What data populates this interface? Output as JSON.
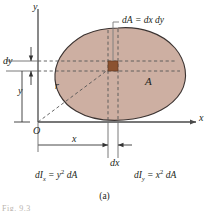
{
  "figure": {
    "caption": "(a)",
    "footnote": "Fig. 9.3",
    "axes": {
      "y_label": "y",
      "x_label": "x",
      "origin_label": "O"
    },
    "labels": {
      "dy": "dy",
      "y": "y",
      "r": "r",
      "x": "x",
      "dx": "dx",
      "area": "A",
      "element_callout_lead": "dA",
      "element_callout_eq": "=",
      "element_callout_rhs": "dx dy"
    },
    "formulas": {
      "ix_lead": "dI",
      "ix_sub": "x",
      "ix_eq": "= y",
      "ix_exp": "2",
      "ix_tail": "dA",
      "iy_lead": "dI",
      "iy_sub": "y",
      "iy_eq": "= x",
      "iy_exp": "2",
      "iy_tail": "dA"
    },
    "colors": {
      "area_fill": "#CDAFA2",
      "area_outline": "#3b3331",
      "element_fill": "#8B5230",
      "axis": "#4a4a4a",
      "dashed": "#555555",
      "text": "#231f20",
      "background": "#ffffff"
    }
  }
}
